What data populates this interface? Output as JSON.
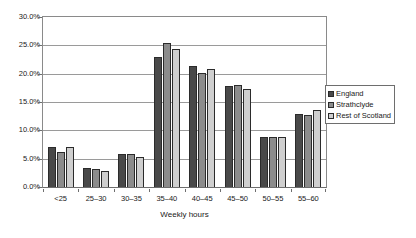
{
  "chart_data": {
    "type": "bar",
    "title": "",
    "subtitle": "",
    "xlabel": "Weekly hours",
    "ylabel": "",
    "categories": [
      "<25",
      "25–30",
      "30–35",
      "35–40",
      "40–45",
      "45–50",
      "50–55",
      "55–60"
    ],
    "series": [
      {
        "name": "England",
        "color": "#494949",
        "values": [
          7.0,
          3.4,
          5.8,
          23.0,
          21.3,
          17.9,
          8.9,
          12.8
        ]
      },
      {
        "name": "Strathclyde",
        "color": "#8c8c8c",
        "values": [
          6.1,
          3.1,
          5.8,
          25.5,
          20.2,
          18.0,
          8.9,
          12.7
        ]
      },
      {
        "name": "Rest of Scotland",
        "color": "#cfcfcf",
        "values": [
          7.0,
          2.9,
          5.3,
          24.3,
          20.8,
          17.3,
          8.9,
          13.6
        ]
      }
    ],
    "ylim": [
      0,
      30
    ],
    "ytick_labels": [
      "0.0%",
      "5.0%",
      "10.0%",
      "15.0%",
      "20.0%",
      "25.0%",
      "30.0%"
    ],
    "ytick_values": [
      0,
      5,
      10,
      15,
      20,
      25,
      30
    ],
    "grid": true,
    "legend_position": "right"
  }
}
